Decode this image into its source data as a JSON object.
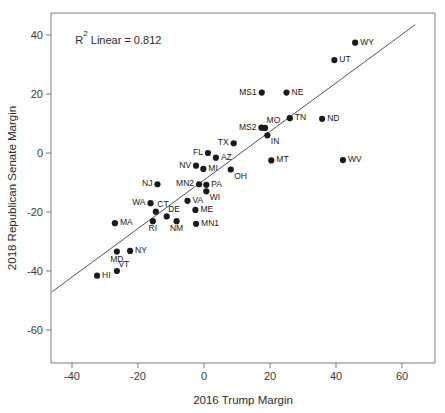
{
  "chart_data": {
    "type": "scatter",
    "title": "",
    "xlabel": "2016 Trump Margin",
    "ylabel": "2018 Republican Senate Margin",
    "xlim": [
      -46,
      64
    ],
    "ylim": [
      -67,
      45
    ],
    "xticks": [
      -40,
      -20,
      0,
      20,
      40,
      60
    ],
    "yticks": [
      40,
      20,
      0,
      -20,
      -40,
      -60
    ],
    "xtick_labels": [
      "-40",
      "-20",
      "0",
      "20",
      "40",
      "60"
    ],
    "ytick_labels": [
      "40",
      "20",
      "0",
      "-20",
      "-40",
      "-60"
    ],
    "grid": false,
    "legend": null,
    "annotations": [
      {
        "name": "r-squared",
        "text_prefix": "R",
        "text_sup": "2",
        "text_suffix": " Linear = 0.812",
        "full_text": "R² Linear = 0.812",
        "x": -39,
        "y": 37
      }
    ],
    "fit_line": {
      "type": "linear",
      "r_squared": 0.812,
      "x_start": -46,
      "y_start": -47,
      "x_end": 64,
      "y_end": 43.5
    },
    "point_color": "#1a1a1a",
    "line_color": "#555555",
    "points": [
      {
        "label": "WY",
        "x": 45.8,
        "y": 37.4,
        "label_pos": "right"
      },
      {
        "label": "UT",
        "x": 39.5,
        "y": 31.5,
        "label_pos": "right"
      },
      {
        "label": "MS1",
        "x": 17.5,
        "y": 20.5,
        "label_pos": "left"
      },
      {
        "label": "NE",
        "x": 25.0,
        "y": 20.5,
        "label_pos": "right"
      },
      {
        "label": "MO",
        "x": 18.5,
        "y": 8.5,
        "label_pos": "above-right"
      },
      {
        "label": "MS2",
        "x": 17.4,
        "y": 8.6,
        "label_pos": "left"
      },
      {
        "label": "IN",
        "x": 19.2,
        "y": 6.0,
        "label_pos": "below-right"
      },
      {
        "label": "TN",
        "x": 26.0,
        "y": 11.8,
        "label_pos": "right"
      },
      {
        "label": "ND",
        "x": 35.8,
        "y": 11.6,
        "label_pos": "right"
      },
      {
        "label": "TX",
        "x": 9.0,
        "y": 3.3,
        "label_pos": "left"
      },
      {
        "label": "FL",
        "x": 1.2,
        "y": 0.0,
        "label_pos": "left"
      },
      {
        "label": "AZ",
        "x": 3.6,
        "y": -1.6,
        "label_pos": "right"
      },
      {
        "label": "NV",
        "x": -2.4,
        "y": -4.3,
        "label_pos": "left"
      },
      {
        "label": "MI",
        "x": -0.2,
        "y": -5.4,
        "label_pos": "right"
      },
      {
        "label": "OH",
        "x": 8.1,
        "y": -5.6,
        "label_pos": "below-right"
      },
      {
        "label": "MT",
        "x": 20.4,
        "y": -2.5,
        "label_pos": "right"
      },
      {
        "label": "WV",
        "x": 42.1,
        "y": -2.4,
        "label_pos": "right"
      },
      {
        "label": "NJ",
        "x": -14.1,
        "y": -10.6,
        "label_pos": "left"
      },
      {
        "label": "MN2",
        "x": -1.5,
        "y": -10.6,
        "label_pos": "left"
      },
      {
        "label": "PA",
        "x": 0.7,
        "y": -10.8,
        "label_pos": "right"
      },
      {
        "label": "WI",
        "x": 0.7,
        "y": -13.0,
        "label_pos": "below-right"
      },
      {
        "label": "WA",
        "x": -16.2,
        "y": -17.0,
        "label_pos": "left"
      },
      {
        "label": "VA",
        "x": -5.0,
        "y": -16.2,
        "label_pos": "right"
      },
      {
        "label": "CT",
        "x": -14.6,
        "y": -19.9,
        "label_pos": "above-right"
      },
      {
        "label": "DE",
        "x": -11.3,
        "y": -21.5,
        "label_pos": "above-right"
      },
      {
        "label": "ME",
        "x": -2.6,
        "y": -19.3,
        "label_pos": "right"
      },
      {
        "label": "MA",
        "x": -27.0,
        "y": -23.8,
        "label_pos": "right"
      },
      {
        "label": "RI",
        "x": -15.5,
        "y": -23.1,
        "label_pos": "below"
      },
      {
        "label": "NM",
        "x": -8.3,
        "y": -23.1,
        "label_pos": "below"
      },
      {
        "label": "MN1",
        "x": -2.4,
        "y": -24.0,
        "label_pos": "right"
      },
      {
        "label": "MD",
        "x": -26.4,
        "y": -33.4,
        "label_pos": "below"
      },
      {
        "label": "NY",
        "x": -22.4,
        "y": -33.2,
        "label_pos": "right"
      },
      {
        "label": "HI",
        "x": -32.4,
        "y": -41.6,
        "label_pos": "right"
      },
      {
        "label": "VT",
        "x": -26.4,
        "y": -40.0,
        "label_pos": "above-right"
      }
    ]
  }
}
